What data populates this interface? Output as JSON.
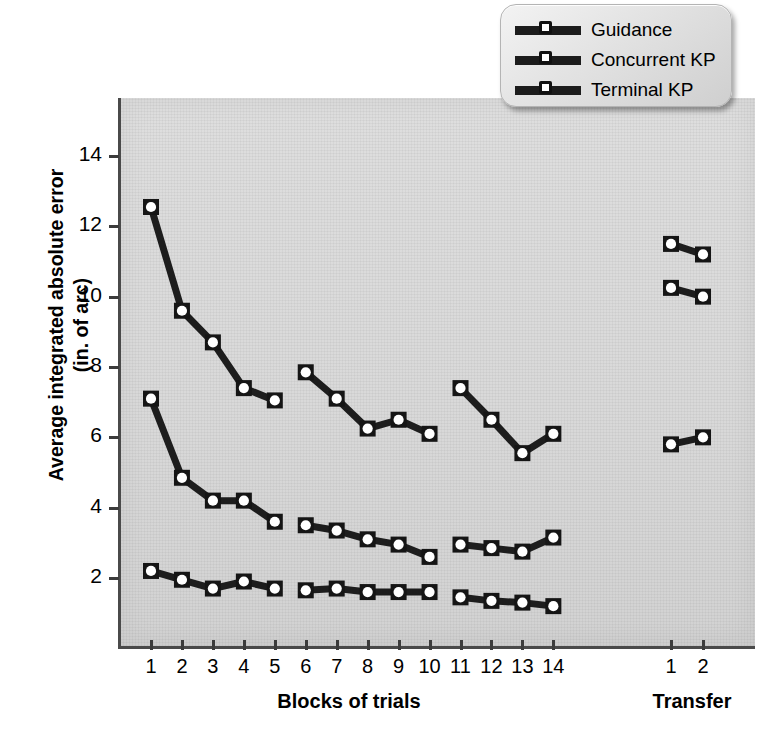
{
  "chart_data": {
    "type": "line",
    "title": "",
    "xlabel": "Blocks of trials",
    "xlabel_secondary": "Transfer",
    "ylabel": "Average integrated absolute error\n(in. of arc)",
    "ylabel_line1": "Average integrated absolute error",
    "ylabel_line2": "(in. of arc)",
    "ylim": [
      0.6,
      15.2
    ],
    "yticks": [
      2,
      4,
      6,
      8,
      10,
      12,
      14
    ],
    "ytick_labels": [
      "2",
      "4",
      "6",
      "8",
      "10",
      "12",
      "14"
    ],
    "grid": false,
    "legend_position": "top-right",
    "categories": [
      "1",
      "2",
      "3",
      "4",
      "5",
      "6",
      "7",
      "8",
      "9",
      "10",
      "11",
      "12",
      "13",
      "14"
    ],
    "transfer_categories": [
      "1",
      "2"
    ],
    "blocks": [
      {
        "name": "acquisition-1",
        "x": [
          "1",
          "2",
          "3",
          "4",
          "5"
        ]
      },
      {
        "name": "acquisition-2",
        "x": [
          "6",
          "7",
          "8",
          "9",
          "10"
        ]
      },
      {
        "name": "acquisition-3",
        "x": [
          "11",
          "12",
          "13",
          "14"
        ]
      },
      {
        "name": "transfer",
        "x": [
          "1",
          "2"
        ]
      }
    ],
    "series": [
      {
        "name": "Guidance",
        "color": "#1d1d1d",
        "segments": [
          {
            "x": [
              "1",
              "2",
              "3",
              "4",
              "5"
            ],
            "values": [
              12.55,
              9.6,
              8.7,
              7.4,
              7.05
            ]
          },
          {
            "x": [
              "6",
              "7",
              "8",
              "9",
              "10"
            ],
            "values": [
              7.85,
              7.1,
              6.25,
              6.5,
              6.1
            ]
          },
          {
            "x": [
              "11",
              "12",
              "13",
              "14"
            ],
            "values": [
              7.4,
              6.5,
              5.55,
              6.1
            ]
          },
          {
            "x": [
              "T1",
              "T2"
            ],
            "values": [
              11.5,
              11.2
            ]
          }
        ]
      },
      {
        "name": "Concurrent KP",
        "color": "#1d1d1d",
        "segments": [
          {
            "x": [
              "1",
              "2",
              "3",
              "4",
              "5"
            ],
            "values": [
              7.1,
              4.85,
              4.2,
              4.2,
              3.6
            ]
          },
          {
            "x": [
              "6",
              "7",
              "8",
              "9",
              "10"
            ],
            "values": [
              3.5,
              3.35,
              3.1,
              2.95,
              2.6
            ]
          },
          {
            "x": [
              "11",
              "12",
              "13",
              "14"
            ],
            "values": [
              2.95,
              2.85,
              2.75,
              3.15
            ]
          },
          {
            "x": [
              "T1",
              "T2"
            ],
            "values": [
              10.25,
              10.0
            ]
          }
        ]
      },
      {
        "name": "Terminal KP",
        "color": "#1d1d1d",
        "segments": [
          {
            "x": [
              "1",
              "2",
              "3",
              "4",
              "5"
            ],
            "values": [
              2.2,
              1.95,
              1.7,
              1.9,
              1.7
            ]
          },
          {
            "x": [
              "6",
              "7",
              "8",
              "9",
              "10"
            ],
            "values": [
              1.65,
              1.7,
              1.6,
              1.6,
              1.6
            ]
          },
          {
            "x": [
              "11",
              "12",
              "13",
              "14"
            ],
            "values": [
              1.45,
              1.35,
              1.3,
              1.2
            ]
          },
          {
            "x": [
              "T1",
              "T2"
            ],
            "values": [
              5.8,
              6.0
            ]
          }
        ]
      }
    ]
  },
  "legend": {
    "items": [
      {
        "label": "Guidance"
      },
      {
        "label": "Concurrent KP"
      },
      {
        "label": "Terminal KP"
      }
    ]
  },
  "axes": {
    "x_labels": [
      "1",
      "2",
      "3",
      "4",
      "5",
      "6",
      "7",
      "8",
      "9",
      "10",
      "11",
      "12",
      "13",
      "14"
    ],
    "x_transfer_labels": [
      "1",
      "2"
    ],
    "y_labels": [
      "14",
      "12",
      "10",
      "8",
      "6",
      "4",
      "2"
    ],
    "x_title": "Blocks of trials",
    "x_transfer_title": "Transfer",
    "y_title_line1": "Average integrated absolute error",
    "y_title_line2": "(in. of arc)"
  }
}
